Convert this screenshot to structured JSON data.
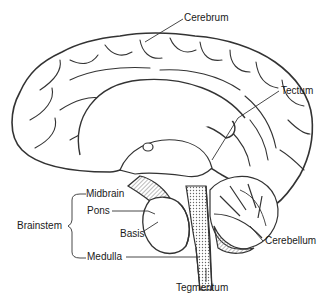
{
  "figure": {
    "stroke_color": "#333333",
    "fill_color": "#ffffff",
    "hatch_color": "#777777"
  },
  "labels": {
    "cerebrum": "Cerebrum",
    "tectum": "Tectum",
    "midbrain": "Midbrain",
    "pons": "Pons",
    "basis": "Basis",
    "brainstem": "Brainstem",
    "medulla": "Medulla",
    "cerebellum": "Cerebellum",
    "tegmentum": "Tegmentum"
  }
}
